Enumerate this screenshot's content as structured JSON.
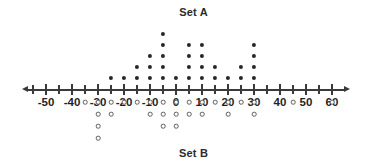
{
  "titles": {
    "set_a": "Set A",
    "set_b": "Set B"
  },
  "chart_data": {
    "type": "scatter",
    "plot_kind": "double-dot-plot",
    "title": "",
    "xlabel": "",
    "ylabel": "",
    "xlim": [
      -57.5,
      65
    ],
    "grid": false,
    "legend_position": "none",
    "axis": {
      "tick_labels": [
        "-50",
        "-40",
        "-30",
        "-20",
        "-10",
        "0",
        "10",
        "20",
        "30",
        "40",
        "50",
        "60"
      ],
      "tick_values": [
        -50,
        -40,
        -30,
        -20,
        -10,
        0,
        10,
        20,
        30,
        40,
        50,
        60
      ],
      "minor_tick_step": 5,
      "minor_tick_values": [
        -55,
        -50,
        -45,
        -40,
        -35,
        -30,
        -25,
        -20,
        -15,
        -10,
        -5,
        0,
        5,
        10,
        15,
        20,
        25,
        30,
        35,
        40,
        45,
        50,
        55,
        60
      ],
      "arrows": [
        "left",
        "right"
      ]
    },
    "series": [
      {
        "name": "Set A",
        "marker": "filled-dot",
        "direction": "above-axis",
        "color": "#262626",
        "x": [
          -25,
          -20,
          -15,
          -10,
          -5,
          0,
          5,
          10,
          15,
          20,
          25,
          30
        ],
        "counts": [
          1,
          1,
          2,
          3,
          5,
          1,
          4,
          4,
          2,
          1,
          2,
          4
        ],
        "total": 30
      },
      {
        "name": "Set B",
        "marker": "open-circle",
        "direction": "below-axis",
        "color": "#5d5d5d",
        "x": [
          -35,
          -30,
          -25,
          -20,
          -15,
          -10,
          -5,
          0,
          5,
          10,
          15,
          20,
          25,
          30,
          45,
          60
        ],
        "counts": [
          1,
          4,
          2,
          1,
          1,
          2,
          3,
          3,
          2,
          2,
          1,
          2,
          1,
          2,
          1,
          1
        ],
        "total": 29
      }
    ]
  },
  "geometry": {
    "origin_x_px": 176,
    "px_per_unit": 2.6,
    "axis_y_px": 89,
    "dot_a_step_px": 11,
    "dot_a_first_offset_px": 11,
    "dot_b_step_px": 12,
    "dot_b_first_offset_px": 13
  }
}
